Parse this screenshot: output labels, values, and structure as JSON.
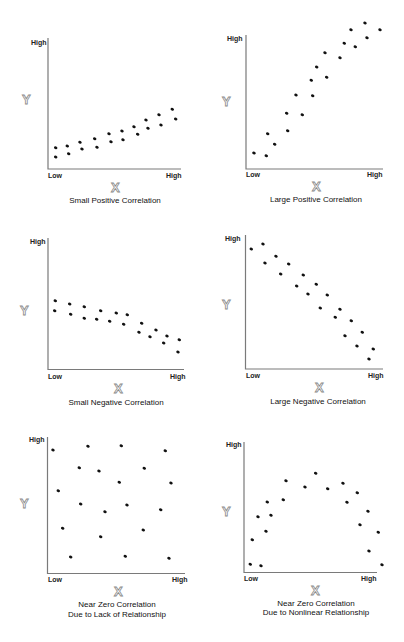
{
  "chart_data": [
    {
      "type": "scatter",
      "title": "Small Positive Correlation",
      "xlabel": "X",
      "ylabel": "Y",
      "x_ticks": [
        "Low",
        "High"
      ],
      "y_ticks": [
        "High"
      ],
      "layout": {
        "origin": [
          48,
          169
        ],
        "x_end": 181,
        "y_top": 38
      },
      "points": [
        [
          55.7,
          147.7
        ],
        [
          55.7,
          157
        ],
        [
          67.3,
          146
        ],
        [
          68.7,
          153.7
        ],
        [
          80,
          142.3
        ],
        [
          82,
          149
        ],
        [
          94.7,
          138.7
        ],
        [
          97,
          147.3
        ],
        [
          109,
          133.7
        ],
        [
          111,
          141.7
        ],
        [
          122,
          131
        ],
        [
          123,
          139.7
        ],
        [
          134,
          126.7
        ],
        [
          137.7,
          134.3
        ],
        [
          146,
          120
        ],
        [
          148,
          128.3
        ],
        [
          159,
          114.7
        ],
        [
          161,
          125
        ],
        [
          172.3,
          109.3
        ],
        [
          175.7,
          119
        ]
      ]
    },
    {
      "type": "scatter",
      "title": "Large Positive Correlation",
      "xlabel": "X",
      "ylabel": "Y",
      "x_ticks": [
        "Low",
        "High"
      ],
      "y_ticks": [
        "High"
      ],
      "layout": {
        "origin": [
          246,
          169
        ],
        "x_end": 383,
        "y_top": 35
      },
      "points": [
        [
          254,
          153
        ],
        [
          266.3,
          155.7
        ],
        [
          267.7,
          133.7
        ],
        [
          274.7,
          144.3
        ],
        [
          286.7,
          113.3
        ],
        [
          287.7,
          130.7
        ],
        [
          296,
          95
        ],
        [
          302.3,
          114.7
        ],
        [
          311.3,
          80.3
        ],
        [
          312.7,
          95.7
        ],
        [
          316.7,
          67
        ],
        [
          326.7,
          77.3
        ],
        [
          325,
          52.7
        ],
        [
          340,
          57.7
        ],
        [
          344.3,
          43.3
        ],
        [
          355.3,
          46.7
        ],
        [
          351,
          29.7
        ],
        [
          365,
          23
        ],
        [
          367,
          37.7
        ],
        [
          380,
          29.7
        ]
      ]
    },
    {
      "type": "scatter",
      "title": "Small Negative Correlation",
      "xlabel": "X",
      "ylabel": "Y",
      "x_ticks": [
        "Low",
        "High"
      ],
      "y_ticks": [
        "High"
      ],
      "layout": {
        "origin": [
          48,
          369.5
        ],
        "x_end": 184,
        "y_top": 238
      },
      "points": [
        [
          55.3,
          300.7
        ],
        [
          54.7,
          310.7
        ],
        [
          69.7,
          304
        ],
        [
          70.7,
          314.3
        ],
        [
          84.3,
          306.7
        ],
        [
          84.3,
          318.3
        ],
        [
          96.7,
          319.3
        ],
        [
          100.7,
          310.7
        ],
        [
          109.7,
          321.3
        ],
        [
          116.3,
          313
        ],
        [
          123.7,
          324.3
        ],
        [
          127.3,
          314.7
        ],
        [
          139,
          332.3
        ],
        [
          141.7,
          323.3
        ],
        [
          150,
          336.7
        ],
        [
          156,
          330
        ],
        [
          163.7,
          343
        ],
        [
          167,
          336
        ],
        [
          178,
          352
        ],
        [
          179.3,
          339.7
        ]
      ]
    },
    {
      "type": "scatter",
      "title": "Large Negative Correlation",
      "xlabel": "X",
      "ylabel": "Y",
      "x_ticks": [
        "Low",
        "High"
      ],
      "y_ticks": [
        "High"
      ],
      "layout": {
        "origin": [
          245.5,
          369
        ],
        "x_end": 383,
        "y_top": 235
      },
      "points": [
        [
          251.3,
          249
        ],
        [
          263,
          244
        ],
        [
          265,
          263
        ],
        [
          276,
          256.3
        ],
        [
          280.7,
          274
        ],
        [
          288.7,
          264
        ],
        [
          296.7,
          286
        ],
        [
          303.3,
          275
        ],
        [
          308,
          294
        ],
        [
          316.3,
          284.3
        ],
        [
          320.3,
          308
        ],
        [
          327.3,
          295
        ],
        [
          335.3,
          317.3
        ],
        [
          340,
          309.3
        ],
        [
          345,
          335.7
        ],
        [
          351.3,
          320.7
        ],
        [
          357,
          346
        ],
        [
          362.3,
          332.3
        ],
        [
          369,
          359
        ],
        [
          373.3,
          349
        ]
      ]
    },
    {
      "type": "scatter",
      "title": "Near Zero Correlation",
      "subtitle": "Due to Lack of Relationship",
      "xlabel": "X",
      "ylabel": "Y",
      "x_ticks": [
        "Low",
        "High"
      ],
      "y_ticks": [
        "High"
      ],
      "layout": {
        "origin": [
          47.5,
          573.5
        ],
        "x_end": 185,
        "y_top": 437
      },
      "points": [
        [
          53,
          450
        ],
        [
          88,
          446.3
        ],
        [
          121.3,
          445.7
        ],
        [
          165.3,
          450.7
        ],
        [
          79.3,
          467.7
        ],
        [
          99,
          471
        ],
        [
          144.3,
          468.3
        ],
        [
          119.3,
          482.3
        ],
        [
          171,
          483
        ],
        [
          58.3,
          490.7
        ],
        [
          80.7,
          504
        ],
        [
          105,
          511.7
        ],
        [
          127,
          505
        ],
        [
          160.7,
          509.7
        ],
        [
          62.7,
          528.3
        ],
        [
          100.7,
          536.7
        ],
        [
          143.3,
          530
        ],
        [
          70.7,
          557
        ],
        [
          125.3,
          556.3
        ],
        [
          169,
          558.3
        ]
      ]
    },
    {
      "type": "scatter",
      "title": "Near Zero Correlation",
      "subtitle": "Due to Nonlinear Relationship",
      "xlabel": "X",
      "ylabel": "Y",
      "x_ticks": [
        "Low",
        "High"
      ],
      "y_ticks": [
        "High"
      ],
      "layout": {
        "origin": [
          244,
          572.5
        ],
        "x_end": 377,
        "y_top": 442
      },
      "points": [
        [
          250.3,
          564.3
        ],
        [
          261,
          565.7
        ],
        [
          252.3,
          539.7
        ],
        [
          258,
          516.7
        ],
        [
          266,
          531.3
        ],
        [
          267.3,
          502
        ],
        [
          271,
          515.3
        ],
        [
          283.3,
          499.7
        ],
        [
          286,
          480.7
        ],
        [
          305,
          487
        ],
        [
          315.7,
          473.3
        ],
        [
          327.7,
          488.7
        ],
        [
          343,
          483.3
        ],
        [
          347,
          502.3
        ],
        [
          357.3,
          492.7
        ],
        [
          360,
          524.7
        ],
        [
          368,
          511.3
        ],
        [
          369,
          551
        ],
        [
          378.3,
          532.3
        ],
        [
          382,
          564.7
        ]
      ]
    }
  ],
  "labels": {
    "low": "Low",
    "high": "High",
    "x": "X",
    "y": "Y",
    "plots": [
      {
        "title": "Small Positive Correlation"
      },
      {
        "title": "Large Positive Correlation"
      },
      {
        "title": "Small Negative Correlation"
      },
      {
        "title": "Large Negative Correlation"
      },
      {
        "title": "Near Zero Correlation",
        "subtitle": "Due to Lack of Relationship"
      },
      {
        "title": "Near Zero Correlation",
        "subtitle": "Due to Nonlinear Relationship"
      }
    ]
  }
}
